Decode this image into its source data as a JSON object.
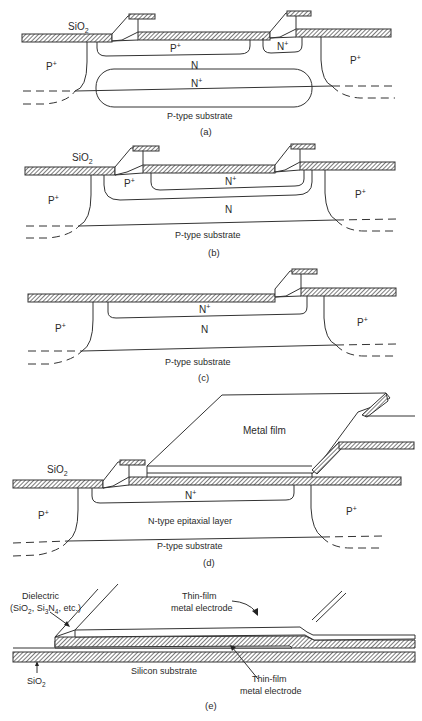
{
  "figure": {
    "panels": [
      {
        "id": "a",
        "caption": "(a)",
        "labels": {
          "oxide": "SiO",
          "oxide_sub": "2",
          "left_isolation": "P",
          "left_isolation_sup": "+",
          "right_isolation": "P",
          "right_isolation_sup": "+",
          "p_diffusion": "P",
          "p_diffusion_sup": "+",
          "n_diffusion": "N",
          "n_diffusion_sup": "+",
          "n_region": "N",
          "buried_layer": "N",
          "buried_layer_sup": "+",
          "substrate": "P-type substrate"
        }
      },
      {
        "id": "b",
        "caption": "(b)",
        "labels": {
          "oxide": "SiO",
          "oxide_sub": "2",
          "left_isolation": "P",
          "left_isolation_sup": "+",
          "right_isolation": "P",
          "right_isolation_sup": "+",
          "p_diffusion": "P",
          "p_diffusion_sup": "+",
          "n_diffusion": "N",
          "n_diffusion_sup": "+",
          "n_region": "N",
          "substrate": "P-type substrate"
        }
      },
      {
        "id": "c",
        "caption": "(c)",
        "labels": {
          "left_isolation": "P",
          "left_isolation_sup": "+",
          "right_isolation": "P",
          "right_isolation_sup": "+",
          "n_diffusion": "N",
          "n_diffusion_sup": "+",
          "n_region": "N",
          "substrate": "P-type substrate"
        }
      },
      {
        "id": "d",
        "caption": "(d)",
        "labels": {
          "oxide": "SiO",
          "oxide_sub": "2",
          "metal": "Metal film",
          "left_isolation": "P",
          "left_isolation_sup": "+",
          "right_isolation": "P",
          "right_isolation_sup": "+",
          "n_diffusion": "N",
          "n_diffusion_sup": "+",
          "epi_layer": "N-type epitaxial layer",
          "substrate": "P-type substrate"
        }
      },
      {
        "id": "e",
        "caption": "(e)",
        "labels": {
          "dielectric_line1": "Dielectric",
          "dielectric_line2_a": "(SiO",
          "dielectric_line2_b": "2",
          "dielectric_line2_c": ", Si",
          "dielectric_line2_d": "3",
          "dielectric_line2_e": "N",
          "dielectric_line2_f": "4",
          "dielectric_line2_g": ", etc.)",
          "top_electrode_line1": "Thin-film",
          "top_electrode_line2": "metal electrode",
          "bottom_electrode_line1": "Thin-film",
          "bottom_electrode_line2": "metal electrode",
          "substrate": "Silicon substrate",
          "oxide": "SiO",
          "oxide_sub": "2"
        }
      }
    ]
  }
}
